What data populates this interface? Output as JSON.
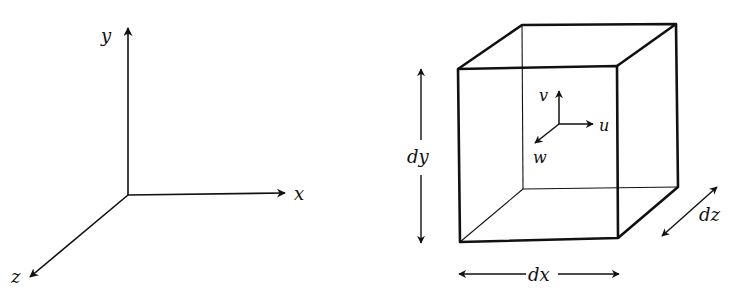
{
  "axes": {
    "x_label": "x",
    "y_label": "y",
    "z_label": "z"
  },
  "element": {
    "velocity": {
      "u_label": "u",
      "v_label": "v",
      "w_label": "w"
    },
    "dimensions": {
      "dx_label": "dx",
      "dy_label": "dy",
      "dz_label": "dz"
    }
  },
  "colors": {
    "ink": "#111111",
    "background": "#ffffff"
  }
}
